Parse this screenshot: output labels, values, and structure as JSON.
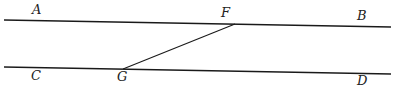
{
  "diagram": {
    "type": "parallel-lines-with-transversal",
    "labels": {
      "A": "A",
      "B": "B",
      "C": "C",
      "D": "D",
      "F": "F",
      "G": "G"
    },
    "lines": [
      {
        "name": "AB",
        "from": [
          4,
          20
        ],
        "to": [
          391,
          27
        ]
      },
      {
        "name": "CD",
        "from": [
          4,
          67
        ],
        "to": [
          391,
          74
        ]
      },
      {
        "name": "FG",
        "from": [
          235,
          24
        ],
        "to": [
          123,
          69
        ]
      }
    ],
    "line_color": "#1a1a1a"
  }
}
